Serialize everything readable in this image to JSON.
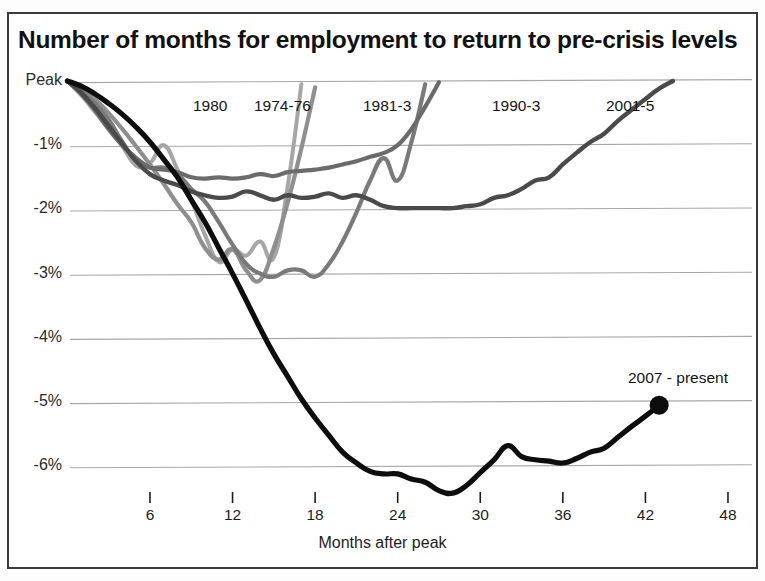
{
  "chart_title": "Number of months for employment to return to pre-crisis levels",
  "axes": {
    "x_title": "Months after peak",
    "x_ticks": [
      "6",
      "12",
      "18",
      "24",
      "30",
      "36",
      "42",
      "48"
    ],
    "y_ticks": [
      "Peak",
      "-1%",
      "-2%",
      "-3%",
      "-4%",
      "-5%",
      "-6%"
    ]
  },
  "colors": {
    "gridline": "#a8a8a8",
    "frame": "#3a3a3a",
    "text": "#141414",
    "s1980": "#a6a6a6",
    "s1974": "#8f8f8f",
    "s1981": "#7a7a7a",
    "s1990": "#6b6b6b",
    "s2001": "#4a4a4a",
    "s2007": "#0d0d0d"
  },
  "series_labels": [
    {
      "name": "1980",
      "x": 193,
      "y": 97
    },
    {
      "name": "1974-76",
      "x": 254,
      "y": 97
    },
    {
      "name": "1981-3",
      "x": 363,
      "y": 97
    },
    {
      "name": "1990-3",
      "x": 492,
      "y": 97
    },
    {
      "name": "2001-5",
      "x": 606,
      "y": 97
    },
    {
      "name": "2007 - present",
      "x": 628,
      "y": 369
    }
  ],
  "chart_data": {
    "type": "line",
    "title": "Number of months for employment to return to pre-crisis levels",
    "xlabel": "Months after peak",
    "ylabel": "",
    "xlim": [
      0,
      48
    ],
    "ylim": [
      -6.6,
      0.2
    ],
    "grid": true,
    "legend": "inline-labels",
    "y_tick_values": [
      0,
      -1,
      -2,
      -3,
      -4,
      -5,
      -6
    ],
    "y_tick_labels": [
      "Peak",
      "-1%",
      "-2%",
      "-3%",
      "-4%",
      "-5%",
      "-6%"
    ],
    "x_tick_values": [
      6,
      12,
      18,
      24,
      30,
      36,
      42,
      48
    ],
    "series": [
      {
        "name": "1980",
        "color": "#a6a6a6",
        "width": 4.0,
        "x": [
          0,
          1,
          2,
          3,
          4,
          5,
          6,
          7,
          8,
          9,
          10,
          11,
          12,
          13,
          14,
          15,
          16,
          17
        ],
        "values": [
          0,
          -0.22,
          -0.48,
          -0.75,
          -1.02,
          -1.32,
          -1.28,
          -1.0,
          -1.38,
          -1.85,
          -2.4,
          -2.82,
          -2.62,
          -2.72,
          -2.5,
          -2.75,
          -1.65,
          -0.05
        ]
      },
      {
        "name": "1974-76",
        "color": "#8f8f8f",
        "width": 4.2,
        "x": [
          0,
          1,
          2,
          3,
          4,
          5,
          6,
          7,
          8,
          9,
          10,
          11,
          12,
          13,
          14,
          15,
          16,
          17,
          18
        ],
        "values": [
          0,
          -0.12,
          -0.28,
          -0.5,
          -0.75,
          -1.02,
          -1.3,
          -1.6,
          -1.92,
          -2.2,
          -2.6,
          -2.78,
          -2.62,
          -2.95,
          -3.1,
          -2.6,
          -1.9,
          -1.05,
          -0.1
        ]
      },
      {
        "name": "1981-3",
        "color": "#7a7a7a",
        "width": 4.2,
        "x": [
          0,
          1,
          2,
          3,
          4,
          5,
          6,
          7,
          8,
          9,
          10,
          11,
          12,
          13,
          14,
          15,
          16,
          17,
          18,
          19,
          20,
          21,
          22,
          23,
          24,
          25,
          26
        ],
        "values": [
          0,
          -0.15,
          -0.35,
          -0.6,
          -0.95,
          -1.25,
          -1.35,
          -1.35,
          -1.45,
          -1.68,
          -1.88,
          -2.2,
          -2.55,
          -2.85,
          -3.0,
          -3.05,
          -2.95,
          -2.95,
          -3.05,
          -2.85,
          -2.5,
          -2.05,
          -1.55,
          -1.2,
          -1.55,
          -0.95,
          -0.05
        ]
      },
      {
        "name": "1990-3",
        "color": "#6b6b6b",
        "width": 4.2,
        "x": [
          0,
          1,
          2,
          3,
          4,
          5,
          6,
          7,
          8,
          9,
          10,
          11,
          12,
          13,
          14,
          15,
          16,
          17,
          18,
          19,
          20,
          21,
          22,
          23,
          24,
          25,
          26,
          27
        ],
        "values": [
          0,
          -0.2,
          -0.45,
          -0.75,
          -1.0,
          -1.2,
          -1.35,
          -1.38,
          -1.42,
          -1.5,
          -1.52,
          -1.5,
          -1.52,
          -1.5,
          -1.45,
          -1.48,
          -1.42,
          -1.4,
          -1.38,
          -1.35,
          -1.3,
          -1.25,
          -1.18,
          -1.12,
          -1.0,
          -0.75,
          -0.4,
          -0.02
        ]
      },
      {
        "name": "2001-5",
        "color": "#4a4a4a",
        "width": 4.4,
        "x": [
          0,
          1,
          2,
          3,
          4,
          5,
          6,
          7,
          8,
          9,
          10,
          11,
          12,
          13,
          14,
          15,
          16,
          17,
          18,
          19,
          20,
          21,
          22,
          23,
          24,
          25,
          26,
          27,
          28,
          29,
          30,
          31,
          32,
          33,
          34,
          35,
          36,
          37,
          38,
          39,
          40,
          41,
          42,
          43,
          44
        ],
        "values": [
          0,
          -0.18,
          -0.42,
          -0.7,
          -0.98,
          -1.25,
          -1.45,
          -1.55,
          -1.62,
          -1.72,
          -1.78,
          -1.82,
          -1.8,
          -1.72,
          -1.78,
          -1.85,
          -1.78,
          -1.82,
          -1.8,
          -1.75,
          -1.82,
          -1.78,
          -1.85,
          -1.95,
          -1.98,
          -1.98,
          -1.98,
          -1.98,
          -1.98,
          -1.95,
          -1.92,
          -1.82,
          -1.78,
          -1.68,
          -1.55,
          -1.5,
          -1.3,
          -1.12,
          -0.95,
          -0.82,
          -0.62,
          -0.45,
          -0.28,
          -0.12,
          0.0
        ]
      },
      {
        "name": "2007 - present",
        "color": "#0d0d0d",
        "width": 5.2,
        "end_marker": true,
        "x": [
          0,
          1,
          2,
          3,
          4,
          5,
          6,
          7,
          8,
          9,
          10,
          11,
          12,
          13,
          14,
          15,
          16,
          17,
          18,
          19,
          20,
          21,
          22,
          23,
          24,
          25,
          26,
          27,
          28,
          29,
          30,
          31,
          32,
          33,
          34,
          35,
          36,
          37,
          38,
          39,
          40,
          41,
          42,
          43
        ],
        "values": [
          0,
          -0.08,
          -0.2,
          -0.35,
          -0.52,
          -0.72,
          -0.95,
          -1.22,
          -1.5,
          -1.85,
          -2.2,
          -2.6,
          -3.0,
          -3.42,
          -3.85,
          -4.25,
          -4.6,
          -4.95,
          -5.25,
          -5.52,
          -5.78,
          -5.95,
          -6.08,
          -6.12,
          -6.12,
          -6.2,
          -6.25,
          -6.38,
          -6.42,
          -6.3,
          -6.1,
          -5.9,
          -5.68,
          -5.85,
          -5.9,
          -5.92,
          -5.95,
          -5.88,
          -5.78,
          -5.72,
          -5.55,
          -5.38,
          -5.22,
          -5.05
        ]
      }
    ]
  }
}
